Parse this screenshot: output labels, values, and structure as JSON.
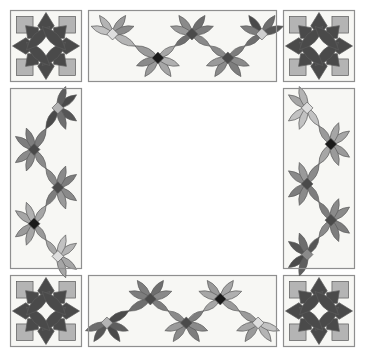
{
  "document": {
    "title": "Quilt Block Layout Diagram",
    "background_color": "#ffffff",
    "canvas": {
      "width": 365,
      "height": 357
    }
  },
  "palette": {
    "background": "#ffffff",
    "block_fill": "#f7f7f4",
    "frame_stroke": "#8f8f8f",
    "patch_stroke": "#5a5a5a",
    "very_dark": "#1a1a1a",
    "dark": "#4a4a4a",
    "dark_alt": "#565656",
    "medium": "#7d7d7d",
    "medium_light": "#9a9a9a",
    "light": "#b4b4b4",
    "very_light": "#cfcfcf",
    "pale": "#dedede"
  },
  "layout": {
    "outer_margin": 10,
    "frame_gap": 6,
    "corner_block_size": 72,
    "center_grid_size": 200,
    "center_grid_rows": 3,
    "center_grid_cols": 3,
    "border_strip_thickness": 72,
    "description": "Nine-patch medallion quilt: four corner wreath blocks, four undulating vine border strips, and a three-by-three center grid of star-wreath blocks."
  },
  "corner_blocks": [
    {
      "name": "corner-top-left",
      "position": "top-left",
      "x": 10,
      "y": 10,
      "w": 72,
      "h": 72,
      "motif": "wreath-star",
      "petal_color": "#4a4a4a",
      "point_color": "#4a4a4a",
      "corner_square_color": "#b4b4b4",
      "center_color": "#f7f7f4"
    },
    {
      "name": "corner-top-right",
      "position": "top-right",
      "x": 283,
      "y": 10,
      "w": 72,
      "h": 72,
      "motif": "wreath-star",
      "petal_color": "#4a4a4a",
      "point_color": "#4a4a4a",
      "corner_square_color": "#b4b4b4",
      "center_color": "#f7f7f4"
    },
    {
      "name": "corner-bottom-left",
      "position": "bottom-left",
      "x": 10,
      "y": 275,
      "w": 72,
      "h": 72,
      "motif": "wreath-star",
      "petal_color": "#4a4a4a",
      "point_color": "#4a4a4a",
      "corner_square_color": "#b4b4b4",
      "center_color": "#f7f7f4"
    },
    {
      "name": "corner-bottom-right",
      "position": "bottom-right",
      "x": 283,
      "y": 275,
      "w": 72,
      "h": 72,
      "motif": "wreath-star",
      "petal_color": "#4a4a4a",
      "point_color": "#4a4a4a",
      "corner_square_color": "#b4b4b4",
      "center_color": "#f7f7f4"
    }
  ],
  "border_strips": [
    {
      "name": "border-top",
      "orientation": "horizontal",
      "x": 88,
      "y": 10,
      "w": 189,
      "h": 72,
      "motif": "undulating-vine",
      "clusters": [
        {
          "index": 0,
          "along": 0.13,
          "side": "up",
          "center_color": "#dedede",
          "petal_colors": [
            "#9a9a9a",
            "#b4b4b4",
            "#8a8a8a",
            "#c2c2c2"
          ]
        },
        {
          "index": 1,
          "along": 0.37,
          "side": "down",
          "center_color": "#1a1a1a",
          "petal_colors": [
            "#9a9a9a",
            "#a6a6a6",
            "#8a8a8a",
            "#b0b0b0"
          ]
        },
        {
          "index": 2,
          "along": 0.55,
          "side": "up",
          "center_color": "#4a4a4a",
          "petal_colors": [
            "#6e6e6e",
            "#8a8a8a",
            "#7d7d7d",
            "#9a9a9a"
          ]
        },
        {
          "index": 3,
          "along": 0.74,
          "side": "down",
          "center_color": "#4a4a4a",
          "petal_colors": [
            "#8a8a8a",
            "#7d7d7d",
            "#9a9a9a",
            "#8a8a8a"
          ]
        },
        {
          "index": 4,
          "along": 0.92,
          "side": "up",
          "center_color": "#cfcfcf",
          "petal_colors": [
            "#6e6e6e",
            "#4a4a4a",
            "#565656",
            "#7d7d7d"
          ]
        }
      ]
    },
    {
      "name": "border-bottom",
      "orientation": "horizontal",
      "x": 88,
      "y": 275,
      "w": 189,
      "h": 72,
      "motif": "undulating-vine",
      "clusters": [
        {
          "index": 0,
          "along": 0.1,
          "side": "down",
          "center_color": "#b4b4b4",
          "petal_colors": [
            "#565656",
            "#4a4a4a",
            "#6e6e6e",
            "#5e5e5e"
          ]
        },
        {
          "index": 1,
          "along": 0.33,
          "side": "up",
          "center_color": "#4a4a4a",
          "petal_colors": [
            "#6e6e6e",
            "#7d7d7d",
            "#8a8a8a",
            "#7d7d7d"
          ]
        },
        {
          "index": 2,
          "along": 0.52,
          "side": "down",
          "center_color": "#4a4a4a",
          "petal_colors": [
            "#8a8a8a",
            "#7d7d7d",
            "#9a9a9a",
            "#8a8a8a"
          ]
        },
        {
          "index": 3,
          "along": 0.7,
          "side": "up",
          "center_color": "#1a1a1a",
          "petal_colors": [
            "#a6a6a6",
            "#9a9a9a",
            "#b0b0b0",
            "#a6a6a6"
          ]
        },
        {
          "index": 4,
          "along": 0.9,
          "side": "down",
          "center_color": "#dedede",
          "petal_colors": [
            "#9a9a9a",
            "#b4b4b4",
            "#a6a6a6",
            "#c2c2c2"
          ]
        }
      ]
    },
    {
      "name": "border-left",
      "orientation": "vertical",
      "x": 10,
      "y": 88,
      "w": 72,
      "h": 181,
      "motif": "undulating-vine",
      "clusters": [
        {
          "index": 0,
          "along": 0.11,
          "side": "up",
          "center_color": "#b4b4b4",
          "petal_colors": [
            "#565656",
            "#4a4a4a",
            "#6e6e6e",
            "#5e5e5e"
          ]
        },
        {
          "index": 1,
          "along": 0.34,
          "side": "down",
          "center_color": "#4a4a4a",
          "petal_colors": [
            "#7d7d7d",
            "#8a8a8a",
            "#7d7d7d",
            "#8a8a8a"
          ]
        },
        {
          "index": 2,
          "along": 0.55,
          "side": "up",
          "center_color": "#4a4a4a",
          "petal_colors": [
            "#8a8a8a",
            "#7d7d7d",
            "#9a9a9a",
            "#8a8a8a"
          ]
        },
        {
          "index": 3,
          "along": 0.75,
          "side": "down",
          "center_color": "#1a1a1a",
          "petal_colors": [
            "#a6a6a6",
            "#9a9a9a",
            "#b0b0b0",
            "#a6a6a6"
          ]
        },
        {
          "index": 4,
          "along": 0.93,
          "side": "up",
          "center_color": "#dedede",
          "petal_colors": [
            "#a6a6a6",
            "#b4b4b4",
            "#a6a6a6",
            "#c2c2c2"
          ]
        }
      ]
    },
    {
      "name": "border-right",
      "orientation": "vertical",
      "x": 283,
      "y": 88,
      "w": 72,
      "h": 181,
      "motif": "undulating-vine",
      "clusters": [
        {
          "index": 0,
          "along": 0.11,
          "side": "down",
          "center_color": "#dedede",
          "petal_colors": [
            "#a6a6a6",
            "#c2c2c2",
            "#b4b4b4",
            "#c2c2c2"
          ]
        },
        {
          "index": 1,
          "along": 0.31,
          "side": "up",
          "center_color": "#1a1a1a",
          "petal_colors": [
            "#9a9a9a",
            "#a6a6a6",
            "#9a9a9a",
            "#a6a6a6"
          ]
        },
        {
          "index": 2,
          "along": 0.53,
          "side": "down",
          "center_color": "#4a4a4a",
          "petal_colors": [
            "#8a8a8a",
            "#7d7d7d",
            "#9a9a9a",
            "#8a8a8a"
          ]
        },
        {
          "index": 3,
          "along": 0.73,
          "side": "up",
          "center_color": "#4a4a4a",
          "petal_colors": [
            "#7d7d7d",
            "#8a8a8a",
            "#7d7d7d",
            "#8a8a8a"
          ]
        },
        {
          "index": 4,
          "along": 0.92,
          "side": "down",
          "center_color": "#8a8a8a",
          "petal_colors": [
            "#565656",
            "#4a4a4a",
            "#6e6e6e",
            "#5e5e5e"
          ]
        }
      ]
    }
  ],
  "center_grid": {
    "name": "center-nine-patch",
    "x": 88,
    "y": 88,
    "w": 189,
    "h": 181,
    "rows": 3,
    "cols": 3,
    "blocks": [
      {
        "row": 0,
        "col": 0,
        "name": "block-r0-c0",
        "petal_color": "#4a4a4a",
        "point_color": "#4a4a4a",
        "diamond_color": "#c2c2c2",
        "center_color": "#f7f7f4"
      },
      {
        "row": 0,
        "col": 1,
        "name": "block-r0-c1",
        "petal_color": "#b4b4b4",
        "point_color": "#565656",
        "diamond_color": "#cfcfcf",
        "center_color": "#f7f7f4"
      },
      {
        "row": 0,
        "col": 2,
        "name": "block-r0-c2",
        "petal_color": "#9a9a9a",
        "point_color": "#8a8a8a",
        "diamond_color": "#1a1a1a",
        "center_color": "#f7f7f4"
      },
      {
        "row": 1,
        "col": 0,
        "name": "block-r1-c0",
        "petal_color": "#b4b4b4",
        "point_color": "#7d7d7d",
        "diamond_color": "#4a4a4a",
        "center_color": "#f7f7f4"
      },
      {
        "row": 1,
        "col": 1,
        "name": "block-r1-c1",
        "petal_color": "#b4b4b4",
        "point_color": "#7d7d7d",
        "diamond_color": "#4a4a4a",
        "center_color": "#f7f7f4"
      },
      {
        "row": 1,
        "col": 2,
        "name": "block-r1-c2",
        "petal_color": "#8a8a8a",
        "point_color": "#7d7d7d",
        "diamond_color": "#6e6e6e",
        "center_color": "#f7f7f4"
      },
      {
        "row": 2,
        "col": 0,
        "name": "block-r2-c0",
        "petal_color": "#9a9a9a",
        "point_color": "#565656",
        "diamond_color": "#cfcfcf",
        "center_color": "#f7f7f4"
      },
      {
        "row": 2,
        "col": 1,
        "name": "block-r2-c1",
        "petal_color": "#4a4a4a",
        "point_color": "#7d7d7d",
        "diamond_color": "#cfcfcf",
        "center_color": "#f7f7f4"
      },
      {
        "row": 2,
        "col": 2,
        "name": "block-r2-c2",
        "petal_color": "#8a8a8a",
        "point_color": "#7d7d7d",
        "diamond_color": "#c2c2c2",
        "center_color": "#f7f7f4"
      }
    ]
  }
}
